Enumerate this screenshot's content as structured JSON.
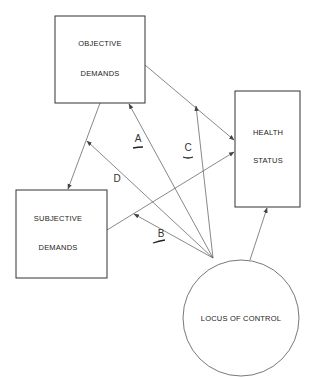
{
  "diagram": {
    "nodes": {
      "objective": {
        "line1": "OBJECTIVE",
        "line2": "DEMANDS"
      },
      "health": {
        "line1": "HEALTH",
        "line2": "STATUS"
      },
      "subjective": {
        "line1": "SUBJECTIVE",
        "line2": "DEMANDS"
      },
      "locus": {
        "label": "LOCUS OF CONTROL"
      }
    },
    "path_labels": {
      "a": "A",
      "b": "B",
      "c": "C",
      "d": "D"
    },
    "edges": [
      {
        "from": "OBJECTIVE DEMANDS",
        "to": "HEALTH STATUS"
      },
      {
        "from": "OBJECTIVE DEMANDS",
        "to": "SUBJECTIVE DEMANDS"
      },
      {
        "from": "SUBJECTIVE DEMANDS",
        "to": "HEALTH STATUS"
      },
      {
        "from": "LOCUS OF CONTROL",
        "to": "OBJECTIVE DEMANDS",
        "label": "A"
      },
      {
        "from": "LOCUS OF CONTROL",
        "to": "SUBJECTIVE-HEALTH path",
        "label": "B"
      },
      {
        "from": "LOCUS OF CONTROL",
        "to": "OBJECTIVE-HEALTH path",
        "label": "C"
      },
      {
        "from": "LOCUS OF CONTROL",
        "to": "OBJECTIVE-SUBJECTIVE path",
        "label": "D"
      },
      {
        "from": "LOCUS OF CONTROL",
        "to": "HEALTH STATUS"
      }
    ]
  }
}
